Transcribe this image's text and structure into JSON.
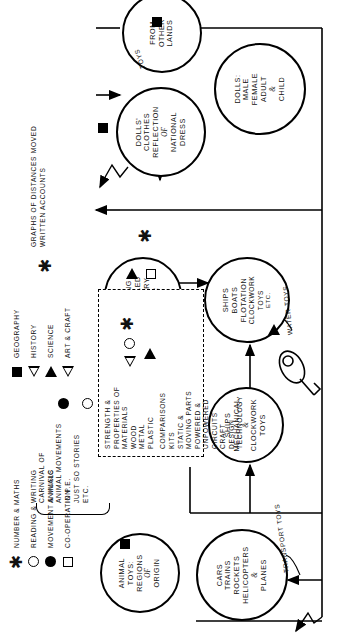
{
  "diagram": {
    "type": "hand-drawn concept map",
    "root_label": "TOYS"
  },
  "nodes": [
    {
      "id": "transport-toys",
      "caption": "TRANSPORT TOYS",
      "lines": [
        "CARS",
        "TRAINS",
        "ROCKETS",
        "HELICOPTERS",
        "&",
        "PLANES"
      ]
    },
    {
      "id": "mechanical-clockwork",
      "lines": [
        "SHIPS",
        "MECHANICAL",
        "&",
        "CLOCKWORK",
        "TOYS"
      ]
    },
    {
      "id": "water-toys",
      "caption": "WATER TOYS",
      "lines": [
        "SHIPS",
        "BOATS",
        "FLOTATION",
        "CLOCKWORK",
        "TOYS",
        "ETC."
      ]
    },
    {
      "id": "animal-toys",
      "lines": [
        "ANIMAL",
        "TOYS:",
        "REGIONS",
        "OF",
        "ORIGIN"
      ]
    },
    {
      "id": "making-models",
      "lines": [
        "MAKING",
        "WHEELED",
        "BATTERY",
        "CAR"
      ]
    },
    {
      "id": "dolls-national-dress",
      "lines": [
        "DOLLS'",
        "CLOTHES",
        "REFLECTION",
        "OF",
        "NATIONAL",
        "DRESS"
      ]
    },
    {
      "id": "dolls-male-female",
      "lines": [
        "DOLLS:",
        "MALE",
        "FEMALE",
        "ADULT",
        "&",
        "CHILD"
      ]
    },
    {
      "id": "toys-other-lands",
      "caption": "TOYS",
      "lines": [
        "FROM",
        "OTHER",
        "LANDS"
      ]
    }
  ],
  "materials_box": {
    "lines": [
      "STRENGTH &",
      "PROPERTIES OF",
      "MATERIALS",
      "WOOD",
      "METAL",
      "PLASTIC",
      "COMPARISONS",
      "KITS",
      "STATIC &",
      "MOVING PARTS",
      "POWERED &",
      "UNPOWERED",
      "CIRCUITS",
      "CRAFT",
      "DESIGN",
      "TECHNOLOGY"
    ]
  },
  "carnival_box": {
    "lines": [
      "CARNIVAL OF",
      "ANIMALS",
      "ANIMAL MOVEMENTS",
      "IN P.E.",
      "JUST SO STORIES",
      "ETC."
    ]
  },
  "graphs_note": {
    "lines": [
      "GRAPHS OF DISTANCES MOVED",
      "WRITTEN ACCOUNTS"
    ]
  },
  "legend": {
    "column_one": [
      {
        "glyph": "asterisk-icon",
        "label": "NUMBER & MATHS"
      },
      {
        "glyph": "circle-outline-icon",
        "label": "READING & WRITING"
      },
      {
        "glyph": "circle-filled-icon",
        "label": "MOVEMENT & MUSIC"
      },
      {
        "glyph": "square-outline-icon",
        "label": "CO-OPERATION"
      }
    ],
    "column_two": [
      {
        "glyph": "square-filled-icon",
        "label": "GEOGRAPHY"
      },
      {
        "glyph": "triangle-outline-icon",
        "label": "HISTORY"
      },
      {
        "glyph": "triangle-filled-icon",
        "label": "SCIENCE"
      },
      {
        "glyph": "triangle-outline-icon",
        "label": "ART & CRAFT"
      }
    ]
  },
  "glyphs": {
    "asterisk": "✱"
  },
  "colors": {
    "ink": "#000000",
    "paper": "#ffffff"
  }
}
